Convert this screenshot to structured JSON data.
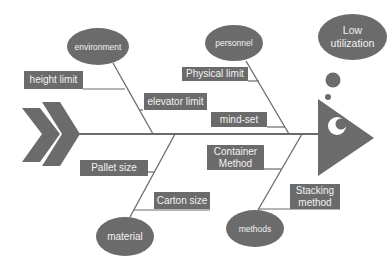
{
  "diagram": {
    "type": "fishbone",
    "effect": "Low utilization",
    "colors": {
      "fill": "#6b6b6b",
      "text": "#f2f2f2",
      "line": "#6b6b6b",
      "background": "#ffffff"
    },
    "categories": [
      {
        "name": "environment",
        "position": "top-left",
        "causes": [
          "height limit",
          "elevator limit"
        ]
      },
      {
        "name": "personnel",
        "position": "top-right",
        "causes": [
          "Physical limit",
          "mind-set"
        ]
      },
      {
        "name": "material",
        "position": "bottom-left",
        "causes": [
          "Pallet size",
          "Carton size"
        ]
      },
      {
        "name": "methods",
        "position": "bottom-right",
        "causes": [
          "Container Method",
          "Stacking method"
        ]
      }
    ]
  },
  "labels": {
    "effect_line1": "Low",
    "effect_line2": "utilization",
    "environment": "environment",
    "personnel": "personnel",
    "material": "material",
    "methods": "methods",
    "height_limit": "height limit",
    "elevator_limit": "elevator limit",
    "physical_limit": "Physical limit",
    "mind_set": "mind-set",
    "pallet_size": "Pallet size",
    "carton_size": "Carton size",
    "container_method_line1": "Container",
    "container_method_line2": "Method",
    "stacking_method_line1": "Stacking",
    "stacking_method_line2": "method"
  }
}
